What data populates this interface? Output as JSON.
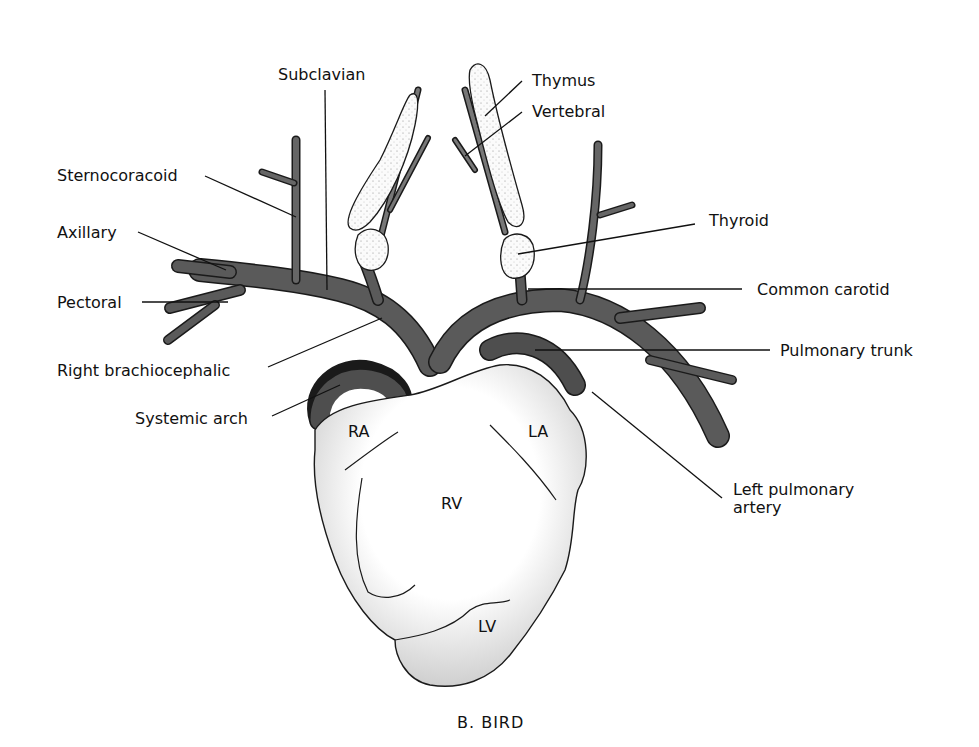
{
  "figure": {
    "caption": "B.  BIRD"
  },
  "labels": {
    "subclavian": "Subclavian",
    "thymus": "Thymus",
    "vertebral": "Vertebral",
    "sternocoracoid": "Sternocoracoid",
    "axillary": "Axillary",
    "pectoral": "Pectoral",
    "thyroid": "Thyroid",
    "common_carotid": "Common carotid",
    "pulmonary_trunk": "Pulmonary trunk",
    "right_brachiocephalic": "Right brachiocephalic",
    "systemic_arch": "Systemic arch",
    "left_pulmonary_artery_line1": "Left pulmonary",
    "left_pulmonary_artery_line2": "artery"
  },
  "chambers": {
    "ra": "RA",
    "la": "LA",
    "rv": "RV",
    "lv": "LV"
  },
  "colors": {
    "vessel": "#5a5a5a",
    "vessel_dark": "#3a3a3a",
    "outline": "#1a1a1a",
    "gland": "#f2f2f2",
    "heart": "#ffffff"
  }
}
